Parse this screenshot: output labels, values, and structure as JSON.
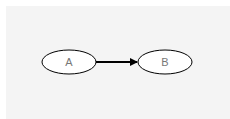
{
  "diagram": {
    "nodes": [
      {
        "id": "A",
        "label": "A",
        "cx": 69,
        "cy": 62,
        "rx": 27,
        "ry": 12
      },
      {
        "id": "B",
        "label": "B",
        "cx": 165,
        "cy": 62,
        "rx": 27,
        "ry": 12
      }
    ],
    "edges": [
      {
        "from": "A",
        "to": "B",
        "directed": true
      }
    ],
    "colors": {
      "background": "#f4f4f4",
      "node_fill": "#ffffff",
      "stroke": "#000000",
      "label": "#777777"
    }
  }
}
